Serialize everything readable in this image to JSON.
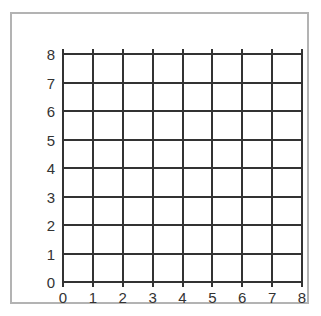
{
  "figure": {
    "background_color": "#ffffff",
    "frame_color": "#b3b3b3",
    "grid_color": "#333333"
  },
  "chart_data": {
    "type": "scatter",
    "title": "",
    "subtitle": "",
    "xlabel": "",
    "ylabel": "",
    "grid": true,
    "legend": null,
    "legend_position": "none",
    "annotations": [],
    "series": [],
    "x": [],
    "values": [],
    "xlim": [
      0,
      8
    ],
    "ylim": [
      0,
      8
    ],
    "x_ticks": [
      "0",
      "1",
      "2",
      "3",
      "4",
      "5",
      "6",
      "7",
      "8"
    ],
    "y_ticks": [
      "8",
      "7",
      "6",
      "5",
      "4",
      "3",
      "2",
      "1",
      "0"
    ],
    "x_tick_values": [
      0,
      1,
      2,
      3,
      4,
      5,
      6,
      7,
      8
    ],
    "y_tick_values": [
      8,
      7,
      6,
      5,
      4,
      3,
      2,
      1,
      0
    ],
    "x_major_step": 1,
    "y_major_step": 1
  }
}
